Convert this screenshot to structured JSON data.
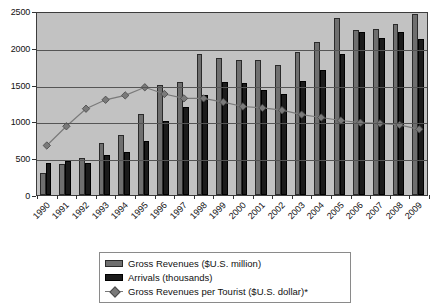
{
  "chart_data": {
    "type": "bar",
    "title": "",
    "subtitle": "",
    "xlabel": "",
    "ylabel": "",
    "ylim": [
      0,
      2500
    ],
    "yticks": [
      0,
      500,
      1000,
      1500,
      2000,
      2500
    ],
    "ytick_labels": [
      "0",
      "500",
      "1000",
      "1500",
      "2000",
      "2500"
    ],
    "grid": true,
    "legend_position": "bottom",
    "categories": [
      "1990",
      "1991",
      "1992",
      "1993",
      "1994",
      "1995",
      "1996",
      "1997",
      "1998",
      "1999",
      "2000",
      "2001",
      "2002",
      "2003",
      "2004",
      "2005",
      "2006",
      "2007",
      "2008",
      "2009"
    ],
    "series": [
      {
        "name": "Gross Revenues ($U.S. million)",
        "type": "bar",
        "color": "#6f6f6f",
        "values": [
          300,
          420,
          500,
          700,
          820,
          1100,
          1500,
          1530,
          1920,
          1860,
          1840,
          1830,
          1770,
          1940,
          2080,
          2400,
          2240,
          2250,
          2320,
          2460
        ]
      },
      {
        "name": "Arrivals (thousands)",
        "type": "bar",
        "color": "#1b1b1b",
        "values": [
          430,
          460,
          430,
          540,
          590,
          740,
          1010,
          1190,
          1360,
          1540,
          1520,
          1430,
          1370,
          1550,
          1700,
          1910,
          2210,
          2130,
          2210,
          2120
        ]
      },
      {
        "name": "Gross Revenues per Tourist ($U.S. dollar)*",
        "type": "line",
        "color": "#7a7a7a",
        "marker": "diamond",
        "values": [
          700,
          960,
          1200,
          1320,
          1380,
          1490,
          1400,
          1340,
          1340,
          1290,
          1230,
          1210,
          1180,
          1120,
          1080,
          1040,
          1010,
          1000,
          980,
          920
        ]
      }
    ]
  },
  "legend": {
    "items": [
      {
        "label": "Gross Revenues ($U.S. million)",
        "swatch": "rev"
      },
      {
        "label": "Arrivals (thousands)",
        "swatch": "arr"
      },
      {
        "label": "Gross Revenues per Tourist ($U.S. dollar)*",
        "swatch": "line"
      }
    ]
  }
}
